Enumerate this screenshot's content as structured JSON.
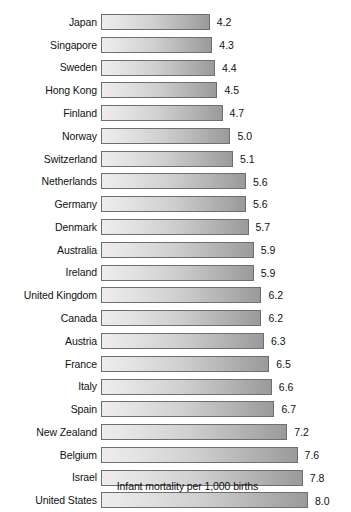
{
  "chart_data": {
    "type": "bar",
    "orientation": "horizontal",
    "title": "",
    "subtitle": "",
    "xlabel": "Infant mortality per 1,000 births",
    "ylabel": "",
    "grid": false,
    "legend": null,
    "xlim": [
      0,
      8.0
    ],
    "value_format": "one-decimal",
    "categories": [
      "Japan",
      "Singapore",
      "Sweden",
      "Hong Kong",
      "Finland",
      "Norway",
      "Switzerland",
      "Netherlands",
      "Germany",
      "Denmark",
      "Australia",
      "Ireland",
      "United Kingdom",
      "Canada",
      "Austria",
      "France",
      "Italy",
      "Spain",
      "New Zealand",
      "Belgium",
      "Israel",
      "United States"
    ],
    "values": [
      4.2,
      4.3,
      4.4,
      4.5,
      4.7,
      5.0,
      5.1,
      5.6,
      5.6,
      5.7,
      5.9,
      5.9,
      6.2,
      6.2,
      6.3,
      6.5,
      6.6,
      6.7,
      7.2,
      7.6,
      7.8,
      8.0
    ],
    "value_labels": [
      "4.2",
      "4.3",
      "4.4",
      "4.5",
      "4.7",
      "5.0",
      "5.1",
      "5.6",
      "5.6",
      "5.7",
      "5.9",
      "5.9",
      "6.2",
      "6.2",
      "6.3",
      "6.5",
      "6.6",
      "6.7",
      "7.2",
      "7.6",
      "7.8",
      "8.0"
    ]
  },
  "style": {
    "bar_gradient_start": "#ededed",
    "bar_gradient_end": "#9a9a9a",
    "bar_border": "#6e6e6e",
    "text_color": "#111111",
    "background": "#ffffff"
  },
  "caption": {
    "text": "Infant mortality per 1,000 births"
  }
}
